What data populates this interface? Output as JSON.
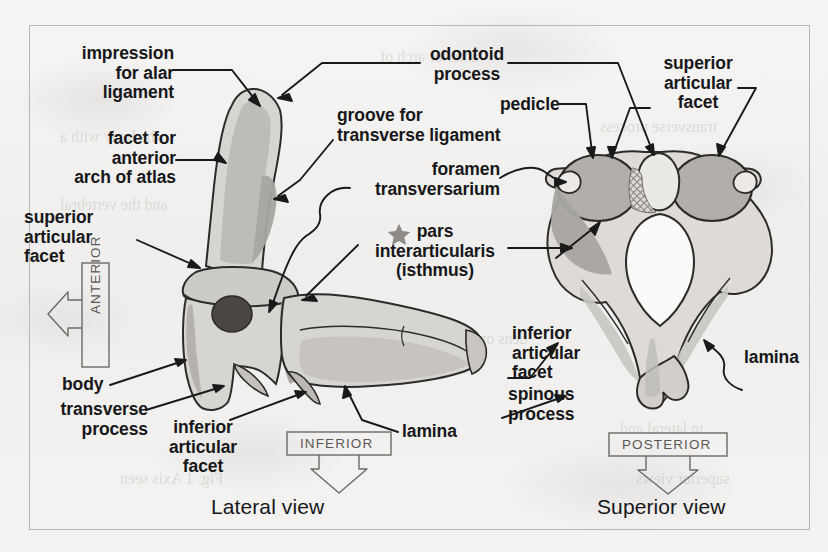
{
  "figure": {
    "captions": {
      "lateral": "Lateral view",
      "superior": "Superior view"
    },
    "accent_colors": {
      "bone_fill": "#d7d5d2",
      "bone_shade": "#b9b6b2",
      "bone_shade_dark": "#9b9894",
      "facet_fill": "#b0adaa",
      "outline": "#2c2b29",
      "foramen_dark": "#47433f",
      "star_gray": "#8e8b88",
      "paper": "#f3f2f0",
      "frame": "#b9b7b4",
      "text": "#17171a",
      "dir_text": "#5b5957"
    }
  },
  "labels": {
    "impression_alar": "impression\nfor alar\nligament",
    "facet_anterior_arch": "facet for\nanterior\narch of atlas",
    "superior_articular_facet_left": "superior\narticular\nfacet",
    "odontoid_process": "odontoid\nprocess",
    "groove_transverse_ligament": "groove for\ntransverse ligament",
    "foramen_transversarium": "foramen\ntransversarium",
    "pars_interarticularis": "pars\ninterarticularis\n(isthmus)",
    "pedicle": "pedicle",
    "superior_articular_facet_right": "superior\narticular\nfacet",
    "body": "body",
    "transverse_process": "transverse\nprocess",
    "inferior_articular_facet_left": "inferior\narticular\nfacet",
    "lamina_lateral": "lamina",
    "inferior_articular_facet_right": "inferior\narticular\nfacet",
    "spinous_process": "spinous\nprocess",
    "lamina_superior": "lamina"
  },
  "direction_markers": {
    "anterior": "ANTERIOR",
    "inferior": "INFERIOR",
    "posterior": "POSTERIOR"
  },
  "legend": {
    "star_icon": "star-icon",
    "star_meaning": "pars interarticularis (isthmus)"
  },
  "ghost_text": {
    "g1": "anterior arch of",
    "g2": "the body with a",
    "g3": "transverse process",
    "g4": "and the vertebral",
    "g5": "Fig. 1 Axis seen",
    "g6": "in lateral and",
    "g7": "superior views",
    "g8": "dens or odontoid"
  }
}
